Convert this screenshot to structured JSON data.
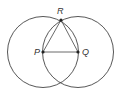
{
  "diagram": {
    "title": "",
    "colors": {
      "stroke": "#444444",
      "point": "#222222",
      "label": "#333333"
    },
    "points": [
      {
        "id": "P",
        "label": "P",
        "x": 43,
        "y": 52
      },
      {
        "id": "Q",
        "label": "Q",
        "x": 78,
        "y": 52
      },
      {
        "id": "R",
        "label": "R",
        "x": 61,
        "y": 20
      }
    ],
    "circles": [
      {
        "center": "P",
        "radius": 35.5
      },
      {
        "center": "Q",
        "radius": 35.5
      }
    ],
    "segments": [
      [
        "P",
        "Q"
      ],
      [
        "P",
        "R"
      ],
      [
        "Q",
        "R"
      ]
    ]
  }
}
